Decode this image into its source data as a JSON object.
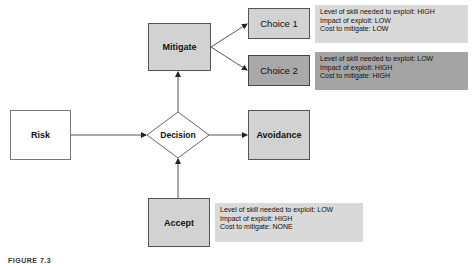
{
  "diagram": {
    "nodes": {
      "risk": {
        "label": "Risk"
      },
      "decision": {
        "label": "Decision"
      },
      "mitigate": {
        "label": "Mitigate"
      },
      "avoidance": {
        "label": "Avoidance"
      },
      "accept": {
        "label": "Accept"
      },
      "choice1": {
        "label": "Choice 1"
      },
      "choice2": {
        "label": "Choice 2"
      }
    },
    "info_boxes": {
      "choice1": {
        "lines": [
          "Level of skill needed to exploit: HIGH",
          "Impact of exploit: LOW",
          "Cost to mitigate: LOW"
        ]
      },
      "choice2": {
        "lines": [
          "Level of skill needed to exploit: LOW",
          "Impact of exploit: HIGH",
          "Cost to mitigate: HIGH"
        ]
      },
      "accept": {
        "lines": [
          "Level of skill needed to exploit: LOW",
          "Impact of exploit: HIGH",
          "Cost to mitigate: NONE"
        ]
      }
    },
    "edges": [
      {
        "from": "Risk",
        "to": "Decision"
      },
      {
        "from": "Accept",
        "to": "Decision"
      },
      {
        "from": "Decision",
        "to": "Mitigate"
      },
      {
        "from": "Decision",
        "to": "Avoidance"
      },
      {
        "from": "Mitigate",
        "to": "Choice 1"
      },
      {
        "from": "Mitigate",
        "to": "Choice 2"
      }
    ],
    "colors": {
      "white_node": "#ffffff",
      "light_node": "#d2d2d2",
      "mid_node": "#a9a9a9",
      "light_info": "#d9d9d9",
      "mid_info": "#a4a4a4",
      "line": "#555555"
    },
    "caption": "FIGURE 7.3"
  }
}
